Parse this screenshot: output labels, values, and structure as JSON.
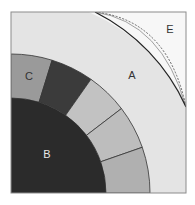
{
  "diagram": {
    "type": "quarter-circle cross-section diagram",
    "frame": {
      "x": 11,
      "y": 12,
      "width": 175,
      "height": 181,
      "stroke": "#8c8c8c"
    },
    "center": {
      "x": 11,
      "y": 193
    },
    "regions": {
      "E": {
        "label": "E",
        "fill": "#f7f7f7",
        "label_pos": [
          170,
          29
        ],
        "label_color": "#333333"
      },
      "A": {
        "label": "A",
        "fill": "#e4e4e4",
        "outer_radius": 197,
        "label_pos": [
          132,
          75
        ],
        "label_color": "#333333"
      },
      "ring": {
        "inner_radius": 95,
        "outer_radius": 139,
        "segments": [
          {
            "id": "C",
            "label": "C",
            "start_deg": 90,
            "end_deg": 72.8,
            "fill": "#9a9a9a",
            "label_pos": [
              29,
              76
            ],
            "label_color": "#333333"
          },
          {
            "id": "seg-dark",
            "label": "",
            "start_deg": 72.8,
            "end_deg": 54.9,
            "fill": "#3b3b3b"
          },
          {
            "id": "seg-light-1",
            "label": "",
            "start_deg": 54.9,
            "end_deg": 37.4,
            "fill": "#c2c2c2"
          },
          {
            "id": "seg-light-2",
            "label": "",
            "start_deg": 37.4,
            "end_deg": 19.2,
            "fill": "#bdbdbd"
          },
          {
            "id": "seg-medium",
            "label": "",
            "start_deg": 19.2,
            "end_deg": 0,
            "fill": "#b0b0b0"
          }
        ]
      },
      "B": {
        "label": "B",
        "fill": "#2b2b2b",
        "radius": 95,
        "label_pos": [
          47,
          154
        ],
        "label_color": "#e8e8e8"
      }
    },
    "boundary_curves": {
      "start": [
        95,
        12
      ],
      "end": [
        186,
        107
      ],
      "solid_ctrl": [
        150,
        30
      ],
      "dashed_ctrl": [
        168,
        20
      ],
      "thin_ctrl": [
        162,
        22
      ],
      "solid_color": "#222222",
      "dashed_color": "#666666",
      "thin_color": "#8a8a8a"
    }
  }
}
